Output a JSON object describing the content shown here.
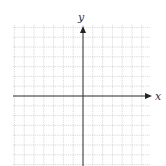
{
  "figure": {
    "type": "coordinate-grid",
    "background": "#ffffff",
    "grid": {
      "left": 13,
      "right": 150,
      "top": 25,
      "bottom": 166,
      "spacing": 9.8,
      "color": "#c8c8c8",
      "dash": "1.2,1"
    },
    "axes": {
      "color": "#333333",
      "origin_px": {
        "x": 83,
        "y": 96
      },
      "x_label": "x",
      "y_label": "y",
      "x_arrow": "right",
      "y_arrow": "up"
    }
  },
  "chart_data": {
    "type": "scatter",
    "title": "",
    "xlabel": "x",
    "ylabel": "y",
    "series": [],
    "grid": true,
    "tick_labels": false,
    "x_grid_cells_left_of_origin": 7,
    "x_grid_cells_right_of_origin": 7,
    "y_grid_cells_above_origin": 7,
    "y_grid_cells_below_origin": 7
  }
}
